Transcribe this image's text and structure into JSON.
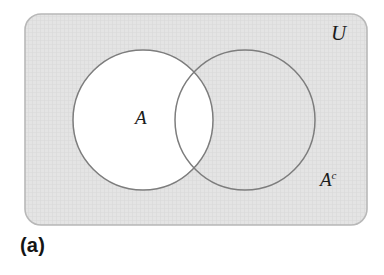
{
  "figure": {
    "caption": "(a)",
    "type": "venn-diagram"
  },
  "labels": {
    "universe": "U",
    "set_a": "A",
    "complement_base": "A",
    "complement_superscript": "c",
    "complement_full": "Ac"
  },
  "colors": {
    "page_background": "#ffffff",
    "universe_fill": "#e3e3e3",
    "universe_border": "#b8b8b8",
    "circle_stroke": "#7d7d7d",
    "shaded_fill": "#e3e3e3",
    "unshaded_fill": "#ffffff",
    "text": "#1b1b1b",
    "caption_text": "#141414",
    "hatch_line": "#d2d2d2"
  },
  "geometry": {
    "canvas": {
      "width": 384,
      "height": 275
    },
    "universe_rect": {
      "x": 25,
      "y": 14,
      "width": 342,
      "height": 211,
      "corner_radius": 16
    },
    "circle_a": {
      "cx": 143,
      "cy": 120,
      "r": 70,
      "fill": "unshaded"
    },
    "circle_b": {
      "cx": 245,
      "cy": 120,
      "r": 70,
      "fill": "shaded"
    },
    "intersection_points": [
      {
        "x": 200,
        "y": 62
      },
      {
        "x": 200,
        "y": 178
      }
    ]
  }
}
